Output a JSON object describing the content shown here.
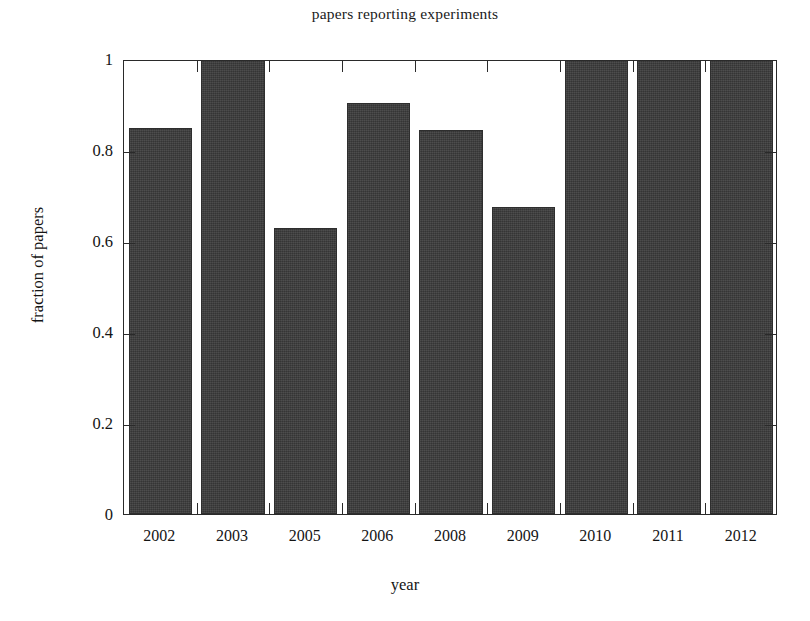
{
  "chart_data": {
    "type": "bar",
    "title": "papers reporting experiments",
    "xlabel": "year",
    "ylabel": "fraction of papers",
    "categories": [
      "2002",
      "2003",
      "2005",
      "2006",
      "2008",
      "2009",
      "2010",
      "2011",
      "2012"
    ],
    "values": [
      0.845,
      1.0,
      0.625,
      0.9,
      0.84,
      0.67,
      1.0,
      1.0,
      1.0
    ],
    "ylim": [
      0,
      1
    ],
    "ytick_labels": [
      "0",
      "0.2",
      "0.4",
      "0.6",
      "0.8",
      "1"
    ],
    "ytick_values": [
      0,
      0.2,
      0.4,
      0.6,
      0.8,
      1
    ],
    "grid": false,
    "legend": null,
    "bar_color": "#3b3b3b",
    "axis_color": "#2a2a2a",
    "background_color": "#ffffff"
  }
}
